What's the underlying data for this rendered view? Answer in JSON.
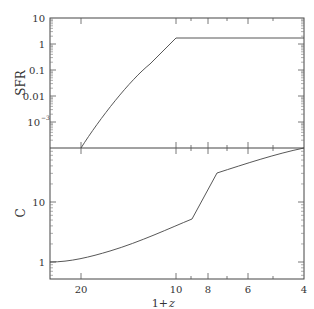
{
  "chart_data": [
    {
      "type": "line",
      "panel": "top",
      "title": "",
      "xlabel": "1+z",
      "ylabel": "SFR",
      "xscale": "log",
      "yscale": "log",
      "xlim": [
        27,
        4
      ],
      "ylim": [
        0.0001,
        10
      ],
      "yticks": [
        "10",
        "1",
        "0.1",
        "0.01",
        "10^-3"
      ],
      "x": [
        20,
        17,
        14,
        12,
        10,
        8,
        6,
        4
      ],
      "series": [
        {
          "name": "SFR",
          "values": [
            0.0001,
            0.002,
            0.03,
            0.2,
            1.7,
            1.7,
            1.7,
            1.7
          ]
        }
      ]
    },
    {
      "type": "line",
      "panel": "bottom",
      "title": "",
      "xlabel": "1+z",
      "ylabel": "C",
      "xscale": "log",
      "yscale": "log",
      "xlim": [
        27,
        4
      ],
      "ylim": [
        0.52,
        80
      ],
      "yticks": [
        "10",
        "1"
      ],
      "xticks": [
        "20",
        "10",
        "8",
        "6",
        "4"
      ],
      "x": [
        27,
        20,
        15,
        12,
        9,
        7.7,
        6,
        5,
        4
      ],
      "series": [
        {
          "name": "C",
          "values": [
            1.0,
            1.2,
            1.8,
            2.7,
            5.2,
            30,
            45,
            60,
            80
          ]
        }
      ]
    }
  ],
  "labels": {
    "top_ylabel": "SFR",
    "bottom_ylabel": "C",
    "xlabel_prefix": "1+",
    "xlabel_var": "z",
    "top_yticks": [
      "10",
      "1",
      "0.1",
      "0.01",
      "10",
      "−3"
    ],
    "bottom_yticks": [
      "10",
      "1"
    ],
    "xticks": [
      "20",
      "10",
      "8",
      "6",
      "4"
    ]
  }
}
